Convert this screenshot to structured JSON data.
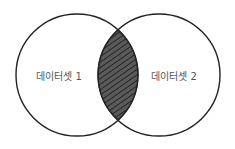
{
  "diagram": {
    "type": "venn",
    "sets": [
      {
        "label": "데이터셋 1"
      },
      {
        "label": "데이터셋 2"
      }
    ],
    "intersection": {
      "fill": "#5a5a5a",
      "hatch": "#2a2a2a",
      "pattern": "diagonal-hatch"
    },
    "colors": {
      "stroke": "#222222",
      "background": "#ffffff",
      "text": "#555555"
    }
  }
}
